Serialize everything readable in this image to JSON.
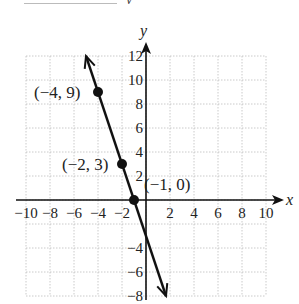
{
  "cutoff_text": {
    "visible_fragment": "y"
  },
  "chart_data": {
    "type": "line",
    "title": "",
    "xlabel": "x",
    "ylabel": "y",
    "xlim": [
      -10,
      10
    ],
    "ylim": [
      -8,
      12
    ],
    "grid": true,
    "grid_step": 2,
    "x_ticks": [
      -10,
      -8,
      -6,
      -4,
      -2,
      2,
      4,
      6,
      8,
      10
    ],
    "x_tick_labels": [
      "−10",
      "−8",
      "−6",
      "−4",
      "−2",
      "2",
      "4",
      "6",
      "8",
      "10"
    ],
    "y_ticks": [
      12,
      10,
      8,
      6,
      4,
      2,
      -4,
      -6,
      -8
    ],
    "y_tick_labels": [
      "12",
      "10",
      "8",
      "6",
      "4",
      "2",
      "−4",
      "−6",
      "−8"
    ],
    "series": [
      {
        "name": "y = -3x - 3",
        "equation": "y = -3x - 3",
        "line_from": [
          -5,
          12
        ],
        "line_to": [
          1.667,
          -8
        ],
        "arrows_both_ends": true,
        "points": [
          {
            "x": -4,
            "y": 9,
            "label": "(−4, 9)"
          },
          {
            "x": -2,
            "y": 3,
            "label": "(−2, 3)"
          },
          {
            "x": -1,
            "y": 0,
            "label": "(−1, 0)"
          }
        ]
      }
    ]
  }
}
